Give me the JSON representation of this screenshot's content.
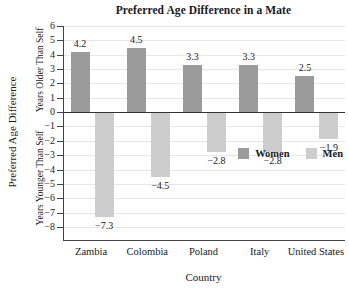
{
  "chart_data": {
    "type": "bar",
    "title": "Preferred Age Difference in a Mate",
    "categories": [
      "Zambia",
      "Colombia",
      "Poland",
      "Italy",
      "United States"
    ],
    "series": [
      {
        "name": "Women",
        "color": "#9b9b9b",
        "values": [
          4.2,
          4.5,
          3.3,
          3.3,
          2.5
        ],
        "labels": [
          "4.2",
          "4.5",
          "3.3",
          "3.3",
          "2.5"
        ]
      },
      {
        "name": "Men",
        "color": "#cdcdcd",
        "values": [
          -7.3,
          -4.5,
          -2.8,
          -2.8,
          -1.9
        ],
        "labels": [
          "−7.3",
          "−4.5",
          "−2.8",
          "−2.8",
          "−1.9"
        ]
      }
    ],
    "xlabel": "Country",
    "ylabel": "Preferred Age Difference",
    "ylabel_positive_region": "Years Older Than Self",
    "ylabel_negative_region": "Years Younger Than Self",
    "ylim": [
      -8,
      6
    ],
    "ytick_step": 1,
    "grid": true,
    "legend_position": "inside-lower-right",
    "colors": {
      "axis": "#444444",
      "zero_line": "#333333",
      "gridline": "#e7e7e7",
      "text": "#1a1a1a"
    }
  }
}
